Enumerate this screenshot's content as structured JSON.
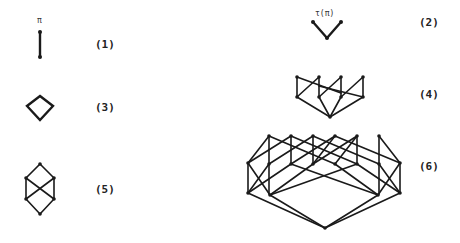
{
  "figures": [
    {
      "id": "1",
      "label": "(1)",
      "annotation": "π",
      "description": "chain of two elements"
    },
    {
      "id": "2",
      "label": "(2)",
      "annotation": "τ(π)",
      "description": "V shape: one bottom element, two top elements"
    },
    {
      "id": "3",
      "label": "(3)",
      "annotation": "",
      "description": "diamond lattice"
    },
    {
      "id": "4",
      "label": "(4)",
      "annotation": "",
      "description": "poset with one bottom, four middle, four top elements"
    },
    {
      "id": "5",
      "label": "(5)",
      "annotation": "",
      "description": "lattice with top, bottom and two crossed middle pairs"
    },
    {
      "id": "6",
      "label": "(6)",
      "annotation": "",
      "description": "large poset with one bottom, four lower, seven middle, six top elements"
    }
  ],
  "colors": {
    "ink": "#1a1a1a",
    "background": "#ffffff"
  }
}
